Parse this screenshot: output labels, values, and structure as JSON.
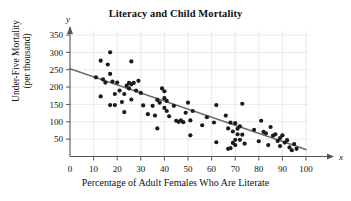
{
  "chart_data": {
    "type": "scatter",
    "title": "Literacy and Child Mortality",
    "xlabel": "Percentage of Adult Females Who Are Literate",
    "ylabel": "Under-Five Mortality\n(per thousand)",
    "x_axis_symbol": "x",
    "y_axis_symbol": "y",
    "xlim": [
      0,
      100
    ],
    "ylim": [
      0,
      360
    ],
    "xticks": [
      0,
      10,
      20,
      30,
      40,
      50,
      60,
      70,
      80,
      90,
      100
    ],
    "yticks": [
      50,
      100,
      150,
      200,
      250,
      300,
      350
    ],
    "grid": true,
    "legend": "none",
    "point_color": "#1a1a1a",
    "line_color": "#6e6e6e",
    "grid_color": "#e4e4e4",
    "axis_color": "#555555",
    "trend_line": {
      "name": "least-squares regression line",
      "x_start": 0,
      "y_start": 253,
      "x_end": 100,
      "y_end": 20
    },
    "points": [
      {
        "x": 11,
        "y": 228
      },
      {
        "x": 13,
        "y": 276
      },
      {
        "x": 13,
        "y": 173
      },
      {
        "x": 14,
        "y": 222
      },
      {
        "x": 15,
        "y": 213
      },
      {
        "x": 16,
        "y": 265
      },
      {
        "x": 17,
        "y": 300
      },
      {
        "x": 17,
        "y": 238
      },
      {
        "x": 17,
        "y": 148
      },
      {
        "x": 18,
        "y": 216
      },
      {
        "x": 19,
        "y": 180
      },
      {
        "x": 19,
        "y": 148
      },
      {
        "x": 20,
        "y": 213
      },
      {
        "x": 21,
        "y": 190
      },
      {
        "x": 22,
        "y": 157
      },
      {
        "x": 23,
        "y": 180
      },
      {
        "x": 23,
        "y": 128
      },
      {
        "x": 24,
        "y": 204
      },
      {
        "x": 25,
        "y": 212
      },
      {
        "x": 25,
        "y": 196
      },
      {
        "x": 26,
        "y": 274
      },
      {
        "x": 26,
        "y": 208
      },
      {
        "x": 26,
        "y": 164
      },
      {
        "x": 27,
        "y": 212
      },
      {
        "x": 28,
        "y": 190
      },
      {
        "x": 29,
        "y": 218
      },
      {
        "x": 30,
        "y": 183
      },
      {
        "x": 31,
        "y": 147
      },
      {
        "x": 33,
        "y": 122
      },
      {
        "x": 35,
        "y": 146
      },
      {
        "x": 36,
        "y": 118
      },
      {
        "x": 37,
        "y": 163
      },
      {
        "x": 37,
        "y": 81
      },
      {
        "x": 38,
        "y": 155
      },
      {
        "x": 39,
        "y": 196
      },
      {
        "x": 40,
        "y": 188
      },
      {
        "x": 40,
        "y": 168
      },
      {
        "x": 40,
        "y": 140
      },
      {
        "x": 41,
        "y": 160
      },
      {
        "x": 41,
        "y": 131
      },
      {
        "x": 42,
        "y": 116
      },
      {
        "x": 44,
        "y": 146
      },
      {
        "x": 45,
        "y": 103
      },
      {
        "x": 46,
        "y": 100
      },
      {
        "x": 47,
        "y": 104
      },
      {
        "x": 48,
        "y": 99
      },
      {
        "x": 49,
        "y": 126
      },
      {
        "x": 50,
        "y": 155
      },
      {
        "x": 51,
        "y": 104
      },
      {
        "x": 51,
        "y": 61
      },
      {
        "x": 52,
        "y": 131
      },
      {
        "x": 56,
        "y": 90
      },
      {
        "x": 58,
        "y": 113
      },
      {
        "x": 61,
        "y": 98
      },
      {
        "x": 62,
        "y": 148
      },
      {
        "x": 62,
        "y": 41
      },
      {
        "x": 66,
        "y": 118
      },
      {
        "x": 67,
        "y": 81
      },
      {
        "x": 67,
        "y": 22
      },
      {
        "x": 68,
        "y": 98
      },
      {
        "x": 68,
        "y": 24
      },
      {
        "x": 69,
        "y": 72
      },
      {
        "x": 69,
        "y": 39
      },
      {
        "x": 70,
        "y": 96
      },
      {
        "x": 70,
        "y": 48
      },
      {
        "x": 70,
        "y": 33
      },
      {
        "x": 71,
        "y": 80
      },
      {
        "x": 71,
        "y": 64
      },
      {
        "x": 72,
        "y": 87
      },
      {
        "x": 72,
        "y": 48
      },
      {
        "x": 73,
        "y": 152
      },
      {
        "x": 73,
        "y": 63
      },
      {
        "x": 74,
        "y": 37
      },
      {
        "x": 78,
        "y": 77
      },
      {
        "x": 80,
        "y": 44
      },
      {
        "x": 81,
        "y": 103
      },
      {
        "x": 82,
        "y": 71
      },
      {
        "x": 83,
        "y": 67
      },
      {
        "x": 84,
        "y": 33
      },
      {
        "x": 85,
        "y": 85
      },
      {
        "x": 86,
        "y": 60
      },
      {
        "x": 87,
        "y": 64
      },
      {
        "x": 88,
        "y": 45
      },
      {
        "x": 89,
        "y": 53
      },
      {
        "x": 89,
        "y": 30
      },
      {
        "x": 90,
        "y": 61
      },
      {
        "x": 91,
        "y": 40
      },
      {
        "x": 92,
        "y": 47
      },
      {
        "x": 93,
        "y": 26
      },
      {
        "x": 94,
        "y": 18
      },
      {
        "x": 95,
        "y": 36
      },
      {
        "x": 96,
        "y": 22
      }
    ]
  }
}
